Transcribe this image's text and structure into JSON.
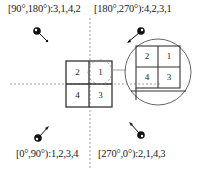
{
  "diagram": {
    "quadrant_labels": [
      {
        "id": "q2",
        "text": "[90°,180°):3,1,4,2"
      },
      {
        "id": "q1",
        "text": "[180°,270°):4,2,3,1"
      },
      {
        "id": "q3",
        "text": "[0°,90°):1,2,3,4"
      },
      {
        "id": "q4",
        "text": "[270°,0°):2,1,4,3"
      }
    ],
    "grid_cells": [
      "2",
      "1",
      "4",
      "3"
    ],
    "zoomed_cells": [
      "2",
      "1",
      "4",
      "3"
    ]
  }
}
